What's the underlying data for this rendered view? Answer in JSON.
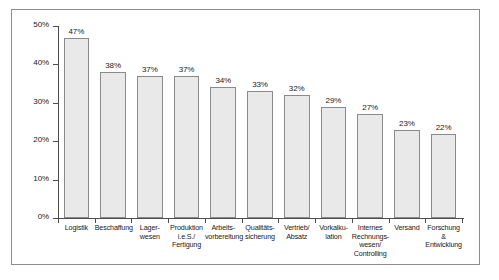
{
  "chart_data": {
    "type": "bar",
    "title": "",
    "subtitle": "",
    "xlabel": "",
    "ylabel": "",
    "ylim": [
      0,
      50
    ],
    "grid": false,
    "legend": "none",
    "y_ticks": [
      "0%",
      "10%",
      "20%",
      "30%",
      "40%",
      "50%"
    ],
    "y_tick_values": [
      0,
      10,
      20,
      30,
      40,
      50
    ],
    "categories": [
      "Logistik",
      "Beschaffung",
      "Lager-\nwesen",
      "Produktion\ni.e.S./\nFertigung",
      "Arbeits-\nvorbereitung",
      "Qualitäts-\nsicherung",
      "Vertrieb/\nAbsatz",
      "Vorkalku-\nlation",
      "Internes\nRechnungs-\nwesen/\nControlling",
      "Versand",
      "Forschung &\nEntwicklung"
    ],
    "values": [
      47,
      38,
      37,
      37,
      34,
      33,
      32,
      29,
      27,
      23,
      22
    ],
    "value_labels": [
      "47%",
      "38%",
      "37%",
      "37%",
      "34%",
      "33%",
      "32%",
      "29%",
      "27%",
      "23%",
      "22%"
    ],
    "bar_fill": "#e9e9e9",
    "bar_border": "#8a8a8a",
    "axis_color": "#4d4d4d",
    "frame_color": "#8d8d8d",
    "background": "#ffffff"
  }
}
